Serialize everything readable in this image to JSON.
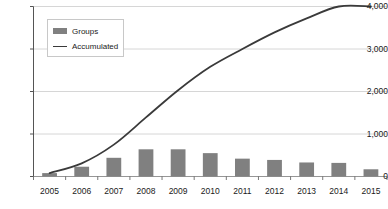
{
  "chart_data": {
    "type": "bar",
    "title": "",
    "xlabel": "",
    "ylabel": "",
    "categories": [
      "2005",
      "2006",
      "2007",
      "2008",
      "2009",
      "2010",
      "2011",
      "2012",
      "2013",
      "2014",
      "2015"
    ],
    "ylim": [
      0,
      4000
    ],
    "yticks": [
      0,
      1000,
      2000,
      3000,
      4000
    ],
    "ytick_labels": [
      "0",
      "1,000",
      "2,000",
      "3,000",
      "4,000"
    ],
    "grid": true,
    "legend_position": "upper-left-inside",
    "series": [
      {
        "name": "Groups",
        "type": "bar",
        "color": "#808080",
        "values": [
          80,
          230,
          440,
          640,
          640,
          550,
          420,
          390,
          330,
          320,
          170
        ]
      },
      {
        "name": "Accumulated",
        "type": "line",
        "color": "#3a3a3a",
        "values": [
          80,
          310,
          750,
          1390,
          2030,
          2580,
          3000,
          3390,
          3720,
          4040,
          4210
        ]
      }
    ]
  },
  "legend": {
    "items": [
      {
        "label": "Groups",
        "marker": "bar-swatch",
        "color": "#808080"
      },
      {
        "label": "Accumulated",
        "marker": "line-swatch",
        "color": "#3a3a3a"
      }
    ]
  },
  "axes": {
    "y_axis_color": "#555555",
    "grid_color": "#cccccc",
    "background": "#ffffff"
  }
}
